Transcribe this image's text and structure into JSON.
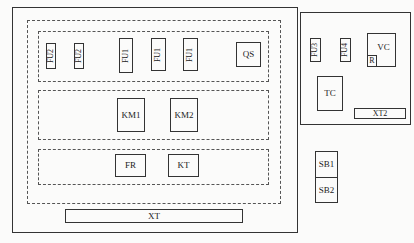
{
  "diagram": {
    "title": "",
    "main_panel": {
      "fuse_group": {
        "components": [
          {
            "label": "FU2",
            "orientation": "vertical"
          },
          {
            "label": "FU2",
            "orientation": "vertical"
          },
          {
            "label": "FU1",
            "orientation": "vertical"
          },
          {
            "label": "FU1",
            "orientation": "vertical"
          },
          {
            "label": "FU1",
            "orientation": "vertical"
          },
          {
            "label": "QS",
            "orientation": "horizontal"
          }
        ]
      },
      "contactor_group": {
        "components": [
          {
            "label": "KM1"
          },
          {
            "label": "KM2"
          }
        ]
      },
      "relay_group": {
        "components": [
          {
            "label": "FR"
          },
          {
            "label": "KT"
          }
        ]
      },
      "terminal_block": {
        "label": "XT"
      }
    },
    "side_panel": {
      "components": [
        {
          "label": "FU3",
          "orientation": "vertical"
        },
        {
          "label": "FU4",
          "orientation": "vertical"
        },
        {
          "label": "VC"
        },
        {
          "label": "R"
        },
        {
          "label": "TC"
        }
      ],
      "terminal_block": {
        "label": "XT2"
      }
    },
    "button_station": {
      "buttons": [
        {
          "label": "SB1"
        },
        {
          "label": "SB2"
        }
      ]
    }
  }
}
